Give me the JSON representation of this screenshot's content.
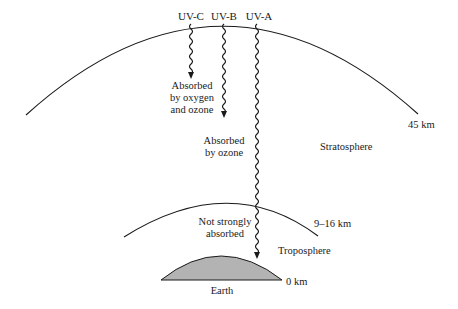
{
  "diagram": {
    "rays": [
      {
        "label": "UV-C",
        "x": 191,
        "end_y": 78,
        "absorption_text": [
          "Absorbed",
          "by oxygen",
          "and ozone"
        ]
      },
      {
        "label": "UV-B",
        "x": 224,
        "end_y": 117,
        "absorption_text": [
          "Absorbed",
          "by ozone"
        ]
      },
      {
        "label": "UV-A",
        "x": 257,
        "end_y": 258,
        "absorption_text": [
          "Not strongly",
          "absorbed"
        ]
      }
    ],
    "layers": [
      {
        "name": "Stratosphere",
        "boundary_label": "45 km"
      },
      {
        "name": "Troposphere",
        "boundary_label": "9–16 km"
      }
    ],
    "earth": {
      "label": "Earth",
      "altitude_label": "0 km",
      "fill": "#b3b3b3"
    },
    "colors": {
      "line": "#1a1a1a",
      "background": "#ffffff",
      "earth": "#b3b3b3"
    }
  }
}
